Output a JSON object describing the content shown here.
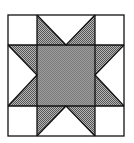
{
  "diagram": {
    "title": "",
    "type": "quilt-block",
    "pattern": "eight-point sawtooth star",
    "grid": {
      "rows": 3,
      "cols": 3
    },
    "colors": {
      "background": "#ffffff",
      "line": "#111111",
      "center_fill": "#8c8c8c",
      "point_fill": "#9a9a9a"
    },
    "pieces": {
      "corner_squares": 4,
      "center_square": 1,
      "star_point_triangles": 8,
      "background_triangles": 4
    }
  }
}
